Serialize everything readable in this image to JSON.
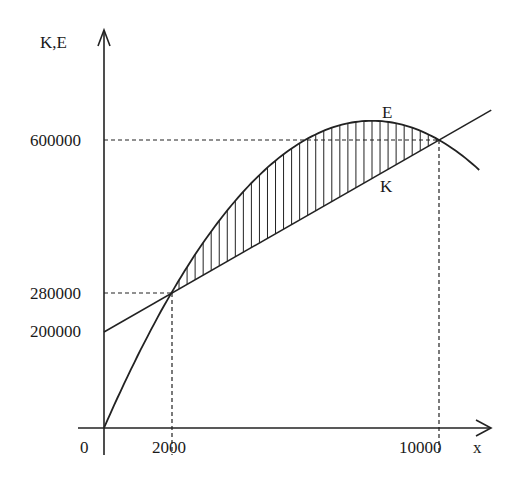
{
  "chart_data": {
    "type": "line",
    "title": "",
    "xlabel": "x",
    "ylabel": "K,E",
    "x_ticks": [
      "0",
      "2000",
      "10000"
    ],
    "y_ticks": [
      "600000",
      "280000",
      "200000"
    ],
    "xlim": [
      0,
      11600
    ],
    "ylim": [
      0,
      650000
    ],
    "grid": false,
    "legend": "inline labels",
    "series": [
      {
        "name": "E",
        "formula": "E(x) = -0.01x^2 + 160x",
        "x": [
          0,
          2000,
          4000,
          6000,
          8000,
          10000,
          11200
        ],
        "values": [
          0,
          280000,
          480000,
          600000,
          640000,
          600000,
          537600
        ]
      },
      {
        "name": "K",
        "formula": "K(x) = 200000 + 40x",
        "x": [
          0,
          2000,
          10000,
          11560
        ],
        "values": [
          200000,
          280000,
          600000,
          662400
        ]
      }
    ],
    "annotations": [
      {
        "type": "intersection",
        "x": 2000,
        "y": 280000
      },
      {
        "type": "intersection",
        "x": 10000,
        "y": 600000
      },
      {
        "type": "hatched-region",
        "between": [
          "E",
          "K"
        ],
        "x_range": [
          2000,
          10000
        ]
      }
    ]
  },
  "labels": {
    "y_axis": "K,E",
    "x_axis": "x",
    "origin": "0",
    "y600": "600000",
    "y280": "280000",
    "y200": "200000",
    "x2000": "2000",
    "x10000": "10000",
    "curve_e": "E",
    "line_k": "K"
  }
}
